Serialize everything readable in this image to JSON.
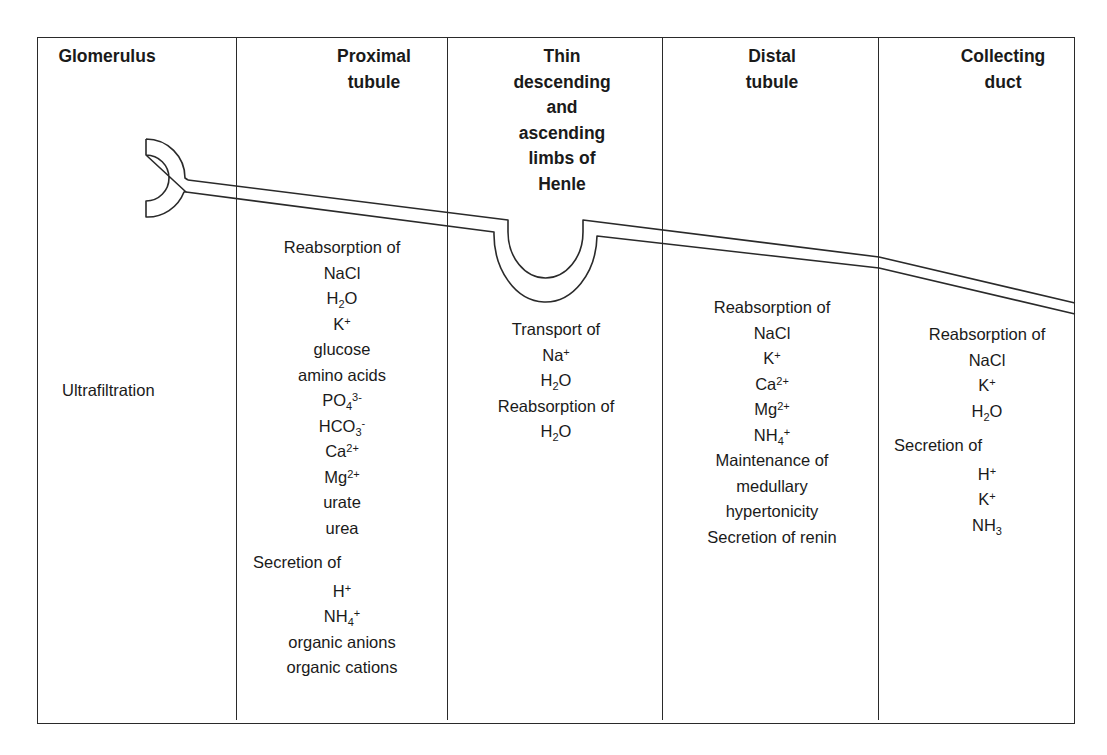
{
  "diagram": {
    "columns": [
      {
        "id": "glomerulus",
        "header": [
          "Glomerulus"
        ],
        "items": [
          {
            "text": "Ultrafiltration",
            "align": "left"
          }
        ]
      },
      {
        "id": "proximal-tubule",
        "header": [
          "Proximal",
          "tubule"
        ],
        "items": [
          {
            "text": "Reabsorption of"
          },
          {
            "text": "NaCl"
          },
          {
            "text": "H₂O",
            "base": "H",
            "sub": "2",
            "tail": "O"
          },
          {
            "text": "K⁺",
            "base": "K",
            "sup": "+"
          },
          {
            "text": "glucose"
          },
          {
            "text": "amino acids"
          },
          {
            "text": "PO₄³⁻",
            "base": "PO",
            "sub": "4",
            "sup": "3-"
          },
          {
            "text": "HCO₃⁻",
            "base": "HCO",
            "sub": "3",
            "sup": "-"
          },
          {
            "text": "Ca²⁺",
            "base": "Ca",
            "sup": "2+"
          },
          {
            "text": "Mg²⁺",
            "base": "Mg",
            "sup": "2+"
          },
          {
            "text": "urate"
          },
          {
            "text": "urea"
          },
          {
            "text": "Secretion of",
            "align": "left"
          },
          {
            "text": "H⁺",
            "base": "H",
            "sup": "+"
          },
          {
            "text": "NH₄⁺",
            "base": "NH",
            "sub": "4",
            "sup": "+"
          },
          {
            "text": "organic anions"
          },
          {
            "text": "organic cations"
          }
        ]
      },
      {
        "id": "loop-of-henle",
        "header": [
          "Thin",
          "descending",
          "and",
          "ascending",
          "limbs of",
          "Henle"
        ],
        "items": [
          {
            "text": "Transport of"
          },
          {
            "text": "Na⁺",
            "base": "Na",
            "sup": "+"
          },
          {
            "text": "H₂O",
            "base": "H",
            "sub": "2",
            "tail": "O"
          },
          {
            "text": "Reabsorption of"
          },
          {
            "text": "H₂O",
            "base": "H",
            "sub": "2",
            "tail": "O"
          }
        ]
      },
      {
        "id": "distal-tubule",
        "header": [
          "Distal",
          "tubule"
        ],
        "items": [
          {
            "text": "Reabsorption of"
          },
          {
            "text": "NaCl"
          },
          {
            "text": "K⁺",
            "base": "K",
            "sup": "+"
          },
          {
            "text": "Ca²⁺",
            "base": "Ca",
            "sup": "2+"
          },
          {
            "text": "Mg²⁺",
            "base": "Mg",
            "sup": "2+"
          },
          {
            "text": "NH₄⁺",
            "base": "NH",
            "sub": "4",
            "sup": "+"
          },
          {
            "text": "Maintenance of"
          },
          {
            "text": "medullary"
          },
          {
            "text": "hypertonicity"
          },
          {
            "text": "Secretion of renin"
          }
        ]
      },
      {
        "id": "collecting-duct",
        "header": [
          "Collecting",
          "duct"
        ],
        "items": [
          {
            "text": "Reabsorption of"
          },
          {
            "text": "NaCl"
          },
          {
            "text": "K⁺",
            "base": "K",
            "sup": "+"
          },
          {
            "text": "H₂O",
            "base": "H",
            "sub": "2",
            "tail": "O"
          },
          {
            "text": "Secretion of",
            "align": "left"
          },
          {
            "text": "H⁺",
            "base": "H",
            "sup": "+"
          },
          {
            "text": "K⁺",
            "base": "K",
            "sup": "+"
          },
          {
            "text": "NH₃",
            "base": "NH",
            "sub": "3"
          }
        ]
      }
    ]
  },
  "colors": {
    "line": "#2a2a2a",
    "text": "#1a1a1a",
    "background": "#ffffff"
  }
}
